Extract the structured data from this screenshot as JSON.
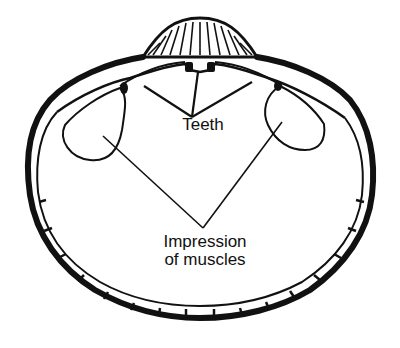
{
  "diagram": {
    "labels": {
      "teeth": "Teeth",
      "muscles_line1": "Impression",
      "muscles_line2": "of muscles"
    },
    "colors": {
      "ink": "#111111",
      "background": "#ffffff"
    }
  }
}
